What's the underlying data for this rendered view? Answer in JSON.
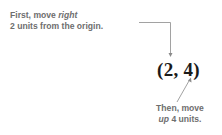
{
  "diagram": {
    "coordinate_label": "(2, 4)",
    "top_annotation": {
      "line1_prefix": "First, move ",
      "line1_emphasis": "right",
      "line2": "2 units from the origin."
    },
    "bottom_annotation": {
      "line1": "Then, move",
      "line2_emphasis": "up",
      "line2_suffix": " 4 units."
    },
    "colors": {
      "annotation_text": "#6e6e6e",
      "coordinate_text": "#1a1a1a",
      "arrow": "#8a8a8a"
    }
  }
}
